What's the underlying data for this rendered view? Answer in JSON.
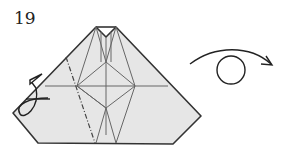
{
  "diagram": {
    "step_number": "19",
    "type": "origami-folding-step",
    "paper_fill": "#e6e6e6",
    "line_color": "#333333",
    "crease_color": "#555555",
    "symbols": {
      "mountain_fold_line": "dash-dot line on left flap",
      "fold_behind_arrow": "curved arrow on left edge",
      "turn_over_symbol": "arc arrow with circle (turn model over)"
    }
  }
}
